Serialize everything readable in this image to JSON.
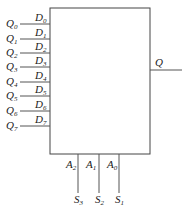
{
  "diagram": {
    "type": "8-to-1 multiplexer block",
    "inputs_external": [
      "Q0",
      "Q1",
      "Q2",
      "Q3",
      "Q4",
      "Q5",
      "Q6",
      "Q7"
    ],
    "inputs_pins": [
      "D0",
      "D1",
      "D2",
      "D3",
      "D4",
      "D5",
      "D6",
      "D7"
    ],
    "output": "Q",
    "address_pins": [
      "A2",
      "A1",
      "A0"
    ],
    "select_signals": [
      "S3",
      "S2",
      "S1"
    ]
  },
  "labels": {
    "q": [
      {
        "b": "Q",
        "s": "0"
      },
      {
        "b": "Q",
        "s": "1"
      },
      {
        "b": "Q",
        "s": "2"
      },
      {
        "b": "Q",
        "s": "3"
      },
      {
        "b": "Q",
        "s": "4"
      },
      {
        "b": "Q",
        "s": "5"
      },
      {
        "b": "Q",
        "s": "6"
      },
      {
        "b": "Q",
        "s": "7"
      }
    ],
    "d": [
      {
        "b": "D",
        "s": "0"
      },
      {
        "b": "D",
        "s": "1"
      },
      {
        "b": "D",
        "s": "2"
      },
      {
        "b": "D",
        "s": "3"
      },
      {
        "b": "D",
        "s": "4"
      },
      {
        "b": "D",
        "s": "5"
      },
      {
        "b": "D",
        "s": "6"
      },
      {
        "b": "D",
        "s": "7"
      }
    ],
    "out": "Q",
    "a": [
      {
        "b": "A",
        "s": "2"
      },
      {
        "b": "A",
        "s": "1"
      },
      {
        "b": "A",
        "s": "0"
      }
    ],
    "s": [
      {
        "b": "S",
        "s": "3"
      },
      {
        "b": "S",
        "s": "2"
      },
      {
        "b": "S",
        "s": "1"
      }
    ]
  }
}
